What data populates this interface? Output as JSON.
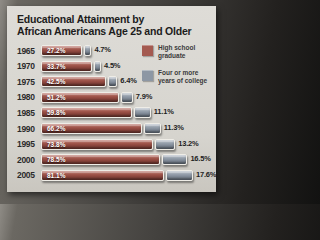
{
  "title": {
    "line1": "Educational Attainment by",
    "line2": "African Americans Age 25 and Older"
  },
  "legend": [
    {
      "label": "High school graduate",
      "color": "#a45a50"
    },
    {
      "label": "Four or more years of college",
      "color": "#8d97a4"
    }
  ],
  "colors": {
    "high_school_bar": "#9a4f45",
    "college_bar": "#8d97a4",
    "card_background": "#d8d6d1",
    "photo_background": "#23211f"
  },
  "chart_data": {
    "type": "bar",
    "orientation": "horizontal",
    "stacked": true,
    "title": "Educational Attainment by African Americans Age 25 and Older",
    "categories": [
      "1965",
      "1970",
      "1975",
      "1980",
      "1985",
      "1990",
      "1995",
      "2000",
      "2005"
    ],
    "series": [
      {
        "name": "High school graduate",
        "values": [
          27.2,
          33.7,
          42.5,
          51.2,
          59.8,
          66.2,
          73.8,
          78.5,
          81.1
        ],
        "labels": [
          "27.2%",
          "33.7%",
          "42.5%",
          "51.2%",
          "59.8%",
          "66.2%",
          "73.8%",
          "78.5%",
          "81.1%"
        ]
      },
      {
        "name": "Four or more years of college",
        "values": [
          4.7,
          4.5,
          6.4,
          7.9,
          11.1,
          11.3,
          13.2,
          16.5,
          17.6
        ],
        "labels": [
          "4.7%",
          "4.5%",
          "6.4%",
          "7.9%",
          "11.1%",
          "11.3%",
          "13.2%",
          "16.5%",
          "17.6%"
        ]
      }
    ],
    "xlabel": "",
    "ylabel": "",
    "xlim": [
      0,
      100
    ],
    "grid": false,
    "legend_position": "top-right",
    "value_labels": "high school % inside bar (white), college % right of bar (dark)"
  }
}
